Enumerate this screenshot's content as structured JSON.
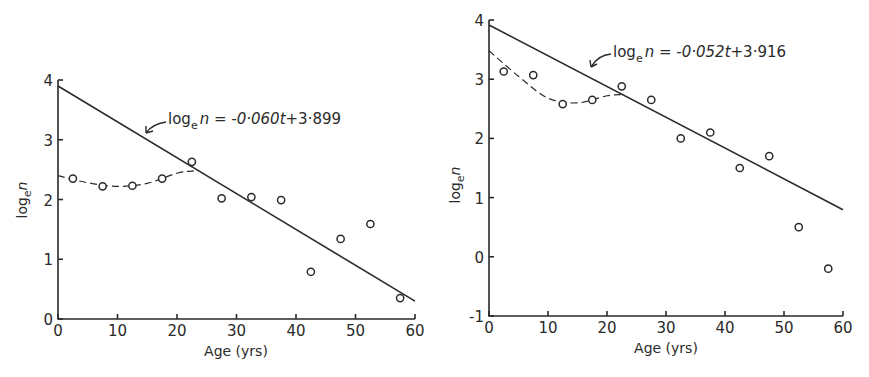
{
  "chart_data": [
    {
      "type": "scatter",
      "title": "",
      "xlabel": "Age (yrs)",
      "ylabel": "log_e n",
      "xlim": [
        0,
        60
      ],
      "ylim": [
        0,
        4
      ],
      "xticks": [
        "0",
        "10",
        "20",
        "30",
        "40",
        "50",
        "60"
      ],
      "yticks": [
        "0",
        "1",
        "2",
        "3",
        "4"
      ],
      "grid": false,
      "points": {
        "x": [
          2.5,
          7.5,
          12.5,
          17.5,
          22.5,
          27.5,
          32.5,
          37.5,
          42.5,
          47.5,
          52.5,
          57.5
        ],
        "y": [
          2.35,
          2.22,
          2.23,
          2.35,
          2.63,
          2.02,
          2.04,
          1.99,
          0.79,
          1.34,
          1.59,
          0.35
        ]
      },
      "fit_line": {
        "slope": -0.06,
        "intercept": 3.899,
        "x_range": [
          0,
          60
        ],
        "style": "solid"
      },
      "smooth_curve": {
        "style": "dashed",
        "x": [
          0,
          5,
          10,
          15,
          20,
          23
        ],
        "y": [
          2.4,
          2.28,
          2.22,
          2.27,
          2.44,
          2.48
        ]
      },
      "annotation": {
        "prefix": "log",
        "sub": "e",
        "suffix": "n = -0·060",
        "var": "t",
        "tail": "+3·899"
      }
    },
    {
      "type": "scatter",
      "title": "",
      "xlabel": "Age (yrs)",
      "ylabel": "log_e n",
      "xlim": [
        0,
        60
      ],
      "ylim": [
        -1,
        4
      ],
      "xticks": [
        "0",
        "10",
        "20",
        "30",
        "40",
        "50",
        "60"
      ],
      "yticks": [
        "-1",
        "0",
        "1",
        "2",
        "3",
        "4"
      ],
      "grid": false,
      "points": {
        "x": [
          2.5,
          7.5,
          12.5,
          17.5,
          22.5,
          27.5,
          32.5,
          37.5,
          42.5,
          47.5,
          52.5,
          57.5
        ],
        "y": [
          3.13,
          3.07,
          2.58,
          2.65,
          2.88,
          2.65,
          2.0,
          2.1,
          1.5,
          1.7,
          0.5,
          -0.2
        ]
      },
      "fit_line": {
        "slope": -0.052,
        "intercept": 3.916,
        "x_range": [
          0,
          60
        ],
        "style": "solid"
      },
      "smooth_curve": {
        "style": "dashed",
        "x": [
          0,
          5,
          10,
          15,
          20,
          23
        ],
        "y": [
          3.48,
          3.05,
          2.68,
          2.6,
          2.72,
          2.74
        ]
      },
      "annotation": {
        "prefix": "log",
        "sub": "e",
        "suffix": "n = -0·052",
        "var": "t",
        "tail": "+3·916"
      }
    }
  ],
  "left": {
    "ylabel_main": "log",
    "ylabel_sub": "e",
    "ylabel_var": "n",
    "xlabel": "Age (yrs)",
    "eq_log": "log",
    "eq_sub": "e",
    "eq_rest": "n = -0·060",
    "eq_var": "t",
    "eq_tail": "+3·899"
  },
  "right": {
    "ylabel_main": "log",
    "ylabel_sub": "e",
    "ylabel_var": "n",
    "xlabel": "Age (yrs)",
    "eq_log": "log",
    "eq_sub": "e",
    "eq_rest": "n = -0·052",
    "eq_var": "t",
    "eq_tail": "+3·916"
  }
}
